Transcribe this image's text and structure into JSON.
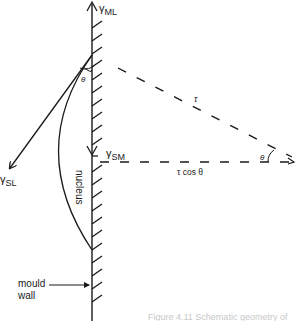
{
  "figure": {
    "labels": {
      "tau_ml": "γ",
      "tau_ml_sub": "ML",
      "tau_sm": "γ",
      "tau_sm_sub": "SM",
      "tau_sl": "γ",
      "tau_sl_sub": "SL",
      "nucleus": "nucleus",
      "theta_top": "θ",
      "theta_right": "θ",
      "tau": "τ",
      "tau_cos_theta": "τ cos θ",
      "mould": "mould",
      "wall": "wall"
    },
    "caption": "Figure 4.11  Schematic geometry of"
  }
}
